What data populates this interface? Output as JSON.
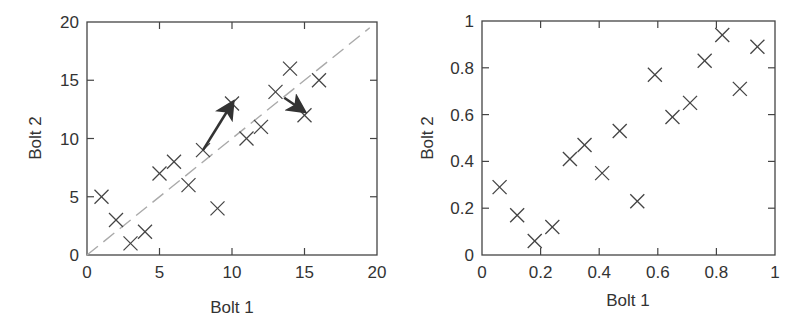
{
  "chart_data": [
    {
      "type": "scatter",
      "title": "",
      "xlabel": "Bolt 1",
      "ylabel": "Bolt 2",
      "xlim": [
        0,
        20
      ],
      "ylim": [
        0,
        20
      ],
      "xticks": [
        0,
        5,
        10,
        15,
        20
      ],
      "yticks": [
        0,
        5,
        10,
        15,
        20
      ],
      "grid": false,
      "marker": "x",
      "series": [
        {
          "name": "points",
          "x": [
            1,
            2,
            3,
            4,
            5,
            6,
            7,
            8,
            9,
            10,
            11,
            12,
            13,
            14,
            15,
            16
          ],
          "y": [
            5,
            3,
            1,
            2,
            7,
            8,
            6,
            9,
            4,
            13,
            10,
            11,
            14,
            16,
            12,
            15
          ]
        }
      ],
      "reference_line": {
        "style": "dashed",
        "color": "#aaaaaa",
        "from": [
          0,
          0
        ],
        "to": [
          19.5,
          19.5
        ]
      },
      "annotations": [
        {
          "type": "arrow",
          "from": [
            8,
            9
          ],
          "to": [
            10,
            13
          ]
        },
        {
          "type": "arrow",
          "from": [
            13.6,
            13.5
          ],
          "to": [
            14.9,
            12.4
          ]
        }
      ]
    },
    {
      "type": "scatter",
      "title": "",
      "xlabel": "Bolt 1",
      "ylabel": "Bolt 2",
      "xlim": [
        0,
        1
      ],
      "ylim": [
        0,
        1
      ],
      "xticks": [
        0,
        0.2,
        0.4,
        0.6,
        0.8,
        1
      ],
      "yticks": [
        0,
        0.2,
        0.4,
        0.6,
        0.8,
        1
      ],
      "grid": false,
      "marker": "x",
      "series": [
        {
          "name": "points",
          "x": [
            0.06,
            0.12,
            0.18,
            0.24,
            0.3,
            0.35,
            0.41,
            0.47,
            0.53,
            0.59,
            0.65,
            0.71,
            0.76,
            0.82,
            0.88,
            0.94
          ],
          "y": [
            0.29,
            0.17,
            0.06,
            0.12,
            0.41,
            0.47,
            0.35,
            0.53,
            0.23,
            0.77,
            0.59,
            0.65,
            0.83,
            0.94,
            0.71,
            0.89
          ]
        }
      ]
    }
  ],
  "left_plot": {
    "xlabel": "Bolt 1",
    "ylabel": "Bolt 2",
    "xtick_labels": [
      "0",
      "5",
      "10",
      "15",
      "20"
    ],
    "ytick_labels": [
      "0",
      "5",
      "10",
      "15",
      "20"
    ]
  },
  "right_plot": {
    "xlabel": "Bolt 1",
    "ylabel": "Bolt 2",
    "xtick_labels": [
      "0",
      "0.2",
      "0.4",
      "0.6",
      "0.8",
      "1"
    ],
    "ytick_labels": [
      "0",
      "0.2",
      "0.4",
      "0.6",
      "0.8",
      "1"
    ]
  },
  "colors": {
    "axis": "#444444",
    "marker": "#444444",
    "reference_line": "#aaaaaa",
    "arrow": "#333333"
  }
}
